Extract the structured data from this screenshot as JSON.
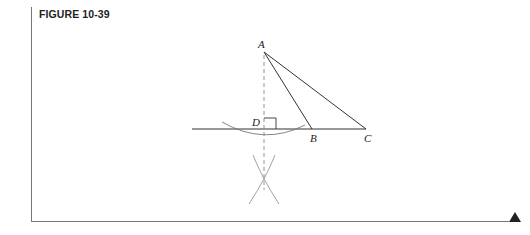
{
  "figure": {
    "title": "FIGURE 10-39"
  },
  "diagram": {
    "points": {
      "A": {
        "label": "A",
        "x": 264,
        "y": 52
      },
      "B": {
        "label": "B",
        "x": 312,
        "y": 129
      },
      "C": {
        "label": "C",
        "x": 366,
        "y": 129
      },
      "D": {
        "label": "D",
        "x": 264,
        "y": 129
      }
    },
    "segments": [
      "AB",
      "AC",
      "line through D, B, C"
    ],
    "construction": [
      "perpendicular from A to line (dashed)",
      "arc centered at A intersecting line",
      "two crossing arcs below line"
    ],
    "right_angle_at": "D"
  },
  "colors": {
    "line": "#333333",
    "construction": "#999999",
    "text": "#222222"
  }
}
